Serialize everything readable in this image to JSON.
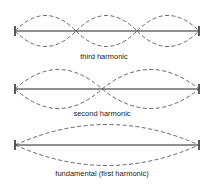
{
  "diagram": {
    "rows": [
      {
        "label": "third harmonic",
        "nodes": 2,
        "loops": 3
      },
      {
        "label": "second harmonic",
        "nodes": 1,
        "loops": 2
      },
      {
        "label": "fundamental (first harmonic)",
        "nodes": 0,
        "loops": 1
      }
    ],
    "colors": {
      "line": "#222222",
      "wave": "#555555"
    }
  }
}
